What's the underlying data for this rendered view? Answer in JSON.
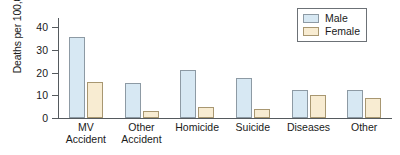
{
  "chart_data": {
    "type": "bar",
    "title": "",
    "xlabel": "",
    "ylabel": "Deaths per 100,000",
    "ylim": [
      0,
      44
    ],
    "yticks": [
      0,
      10,
      20,
      30,
      40
    ],
    "ytick_labels": [
      "0",
      "10",
      "20",
      "30",
      "40"
    ],
    "grid": false,
    "legend_position": "top-right",
    "categories": [
      "MV\nAccident",
      "Other\nAccident",
      "Homicide",
      "Suicide",
      "Diseases",
      "Other"
    ],
    "series": [
      {
        "name": "Male",
        "color": "#d7e8f3",
        "edge_color": "#8d9aa4",
        "values": [
          35.5,
          15.5,
          21.0,
          17.7,
          12.4,
          12.4
        ]
      },
      {
        "name": "Female",
        "color": "#f8ecd2",
        "edge_color": "#a89771",
        "values": [
          16.0,
          3.3,
          5.0,
          4.0,
          10.0,
          9.0
        ]
      }
    ]
  }
}
